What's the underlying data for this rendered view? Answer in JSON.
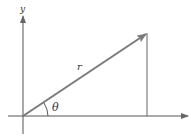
{
  "diagram": {
    "type": "polar-coordinate-vector",
    "labels": {
      "y_axis": "y",
      "x_axis": ".",
      "radius": "r",
      "angle": "θ"
    },
    "colors": {
      "vector": "#7a7a7a",
      "axes": "#555555",
      "text": "#333333"
    }
  }
}
